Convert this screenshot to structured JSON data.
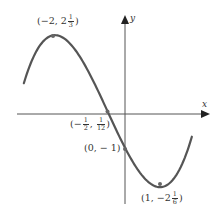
{
  "chart_data": {
    "type": "line",
    "title": "",
    "function": "f(x) = x^3/3 + x^2/2 - 2x - 1",
    "xlabel": "x",
    "ylabel": "y",
    "xlim": [
      -3.2,
      2.4
    ],
    "ylim": [
      -2.6,
      2.8
    ],
    "grid": false,
    "legend": null,
    "curve_domain": [
      -2.89,
      1.91
    ],
    "series": [
      {
        "name": "f",
        "color": "#555555",
        "points": [
          {
            "x": -2.89,
            "y": 1.26
          },
          {
            "x": -2.5,
            "y": 2.02
          },
          {
            "x": -2,
            "y": 2.333
          },
          {
            "x": -1.5,
            "y": 2.0
          },
          {
            "x": -1,
            "y": 1.167
          },
          {
            "x": -0.5,
            "y": 0.083
          },
          {
            "x": 0,
            "y": -1
          },
          {
            "x": 0.5,
            "y": -1.833
          },
          {
            "x": 1,
            "y": -2.167
          },
          {
            "x": 1.5,
            "y": -1.75
          },
          {
            "x": 1.91,
            "y": -0.67
          }
        ]
      }
    ],
    "annotations": [
      {
        "name": "local-max",
        "x": -2,
        "y": 2.333,
        "label": {
          "pre": "(−2, 2",
          "num": "1",
          "den": "3",
          "post": ")"
        }
      },
      {
        "name": "inflection",
        "x": -0.5,
        "y": 0.0833,
        "label": {
          "pre": "(−",
          "num1": "1",
          "den1": "2",
          "mid": ",",
          "num2": "1",
          "den2": "12",
          "post": ")"
        }
      },
      {
        "name": "y-intercept",
        "x": 0,
        "y": -1,
        "label": {
          "text": "(0, − 1)"
        }
      },
      {
        "name": "local-min",
        "x": 1,
        "y": -2.167,
        "label": {
          "pre": "(1, −2",
          "num": "1",
          "den": "6",
          "post": ")"
        }
      }
    ]
  },
  "labels": {
    "x_axis": "x",
    "y_axis": "y",
    "max": {
      "pre": "(−2, 2",
      "num": "1",
      "den": "3",
      "post": ")"
    },
    "inflection": {
      "pre": "(−",
      "num1": "1",
      "den1": "2",
      "sep": ",",
      "num2": "1",
      "den2": "12",
      "post": ")"
    },
    "intercept": "(0, − 1)",
    "min": {
      "pre": "(1, −2",
      "num": "1",
      "den": "6",
      "post": ")"
    }
  }
}
